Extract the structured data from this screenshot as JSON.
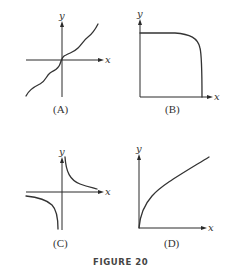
{
  "figure": {
    "caption": "FIGURE 20",
    "panels": [
      {
        "id": "A",
        "label": "(A)",
        "x_axis_label": "x",
        "y_axis_label": "y",
        "description": "wavy increasing curve through origin"
      },
      {
        "id": "B",
        "label": "(B)",
        "x_axis_label": "x",
        "y_axis_label": "y",
        "description": "flat then sharply decreasing curve (quarter-ellipse-like)"
      },
      {
        "id": "C",
        "label": "(C)",
        "x_axis_label": "x",
        "y_axis_label": "y",
        "description": "hyperbola y = 1/x with two branches"
      },
      {
        "id": "D",
        "label": "(D)",
        "x_axis_label": "x",
        "y_axis_label": "y",
        "description": "square-root-like increasing concave curve from origin"
      }
    ]
  },
  "colors": {
    "ink": "#333333",
    "background": "#ffffff"
  }
}
